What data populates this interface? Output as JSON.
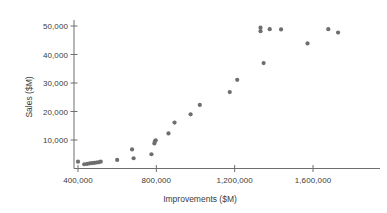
{
  "chart_data": {
    "type": "scatter",
    "title": "",
    "xlabel": "Improvements ($M)",
    "ylabel": "Sales ($M)",
    "xlim": [
      330000,
      1780000
    ],
    "ylim": [
      0,
      54000
    ],
    "xticks": [
      400000,
      800000,
      1200000,
      1600000
    ],
    "xtick_labels": [
      "400,000",
      "800,000",
      "1,200,000",
      "1,600,000"
    ],
    "yticks": [
      10000,
      20000,
      30000,
      40000,
      50000
    ],
    "ytick_labels": [
      "10,000",
      "20,000",
      "30,000",
      "40,000",
      "50,000"
    ],
    "grid": false,
    "legend": null,
    "marker_color": "#6e6e6e",
    "axis_color": "#6e6e6e",
    "points": [
      {
        "x": 400000,
        "y": 2400
      },
      {
        "x": 432000,
        "y": 1500
      },
      {
        "x": 447000,
        "y": 1600
      },
      {
        "x": 460000,
        "y": 1800
      },
      {
        "x": 472000,
        "y": 1900
      },
      {
        "x": 484000,
        "y": 2000
      },
      {
        "x": 495000,
        "y": 2100
      },
      {
        "x": 505000,
        "y": 2200
      },
      {
        "x": 516000,
        "y": 2400
      },
      {
        "x": 600000,
        "y": 3000
      },
      {
        "x": 676000,
        "y": 6700
      },
      {
        "x": 684000,
        "y": 3600
      },
      {
        "x": 775000,
        "y": 5000
      },
      {
        "x": 790000,
        "y": 8800
      },
      {
        "x": 793000,
        "y": 9600
      },
      {
        "x": 797000,
        "y": 9900
      },
      {
        "x": 862000,
        "y": 12300
      },
      {
        "x": 893000,
        "y": 16100
      },
      {
        "x": 975000,
        "y": 19000
      },
      {
        "x": 1022000,
        "y": 22300
      },
      {
        "x": 1175000,
        "y": 26800
      },
      {
        "x": 1213000,
        "y": 31100
      },
      {
        "x": 1332000,
        "y": 48200
      },
      {
        "x": 1332000,
        "y": 49400
      },
      {
        "x": 1348000,
        "y": 37000
      },
      {
        "x": 1379000,
        "y": 48900
      },
      {
        "x": 1437000,
        "y": 48800
      },
      {
        "x": 1572000,
        "y": 43900
      },
      {
        "x": 1678000,
        "y": 48900
      },
      {
        "x": 1728000,
        "y": 47700
      }
    ]
  }
}
